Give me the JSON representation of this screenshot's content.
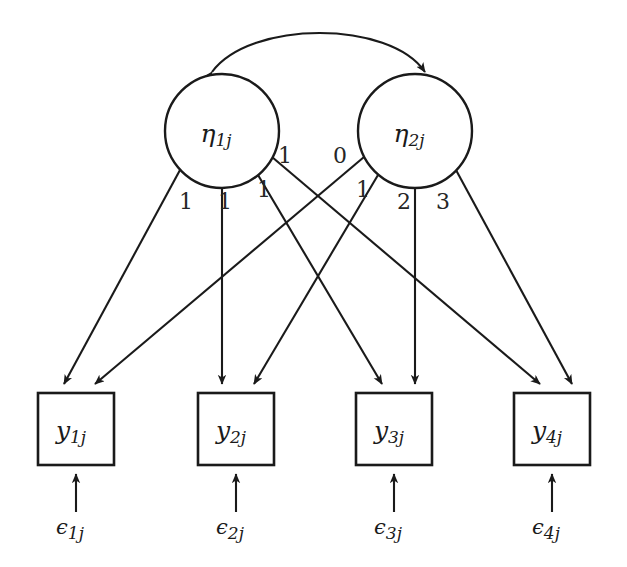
{
  "diagram": {
    "type": "path-diagram",
    "model": "linear latent growth curve model",
    "canvas": {
      "width": 627,
      "height": 567,
      "background": "#ffffff"
    },
    "stroke_color": "#1a1a1a"
  },
  "latent_factors": [
    {
      "id": "eta1",
      "label_base": "η",
      "label_sub": "1j",
      "role": "intercept",
      "cx": 222,
      "cy": 131,
      "r": 57
    },
    {
      "id": "eta2",
      "label_base": "η",
      "label_sub": "2j",
      "role": "slope",
      "cx": 415,
      "cy": 131,
      "r": 57
    }
  ],
  "observed_variables": [
    {
      "id": "y1",
      "label_base": "y",
      "label_sub": "1j",
      "x": 38,
      "y": 393,
      "w": 76,
      "h": 72
    },
    {
      "id": "y2",
      "label_base": "y",
      "label_sub": "2j",
      "x": 198,
      "y": 393,
      "w": 76,
      "h": 72
    },
    {
      "id": "y3",
      "label_base": "y",
      "label_sub": "3j",
      "x": 356,
      "y": 393,
      "w": 76,
      "h": 72
    },
    {
      "id": "y4",
      "label_base": "y",
      "label_sub": "4j",
      "x": 514,
      "y": 393,
      "w": 76,
      "h": 72
    }
  ],
  "error_terms": [
    {
      "id": "eps1",
      "label_base": "ϵ",
      "label_sub": "1j",
      "x": 76,
      "y": 527
    },
    {
      "id": "eps2",
      "label_base": "ϵ",
      "label_sub": "2j",
      "x": 236,
      "y": 527
    },
    {
      "id": "eps3",
      "label_base": "ϵ",
      "label_sub": "3j",
      "x": 394,
      "y": 527
    },
    {
      "id": "eps4",
      "label_base": "ϵ",
      "label_sub": "4j",
      "x": 552,
      "y": 527
    }
  ],
  "loadings": {
    "intercept_factor": {
      "from": "eta1",
      "targets": [
        "y1",
        "y2",
        "y3",
        "y4"
      ],
      "values": [
        "1",
        "1",
        "1",
        "1"
      ],
      "label_positions": [
        {
          "x": 186,
          "y": 201
        },
        {
          "x": 225,
          "y": 201
        },
        {
          "x": 264,
          "y": 189
        },
        {
          "x": 285,
          "y": 155
        }
      ]
    },
    "slope_factor": {
      "from": "eta2",
      "targets": [
        "y1",
        "y2",
        "y3",
        "y4"
      ],
      "values": [
        "0",
        "1",
        "2",
        "3"
      ],
      "label_positions": [
        {
          "x": 340,
          "y": 155
        },
        {
          "x": 363,
          "y": 189
        },
        {
          "x": 404,
          "y": 201
        },
        {
          "x": 443,
          "y": 201
        }
      ]
    }
  },
  "covariance": {
    "between": [
      "eta1",
      "eta2"
    ],
    "style": "curved double-headed arrow",
    "label": ""
  }
}
